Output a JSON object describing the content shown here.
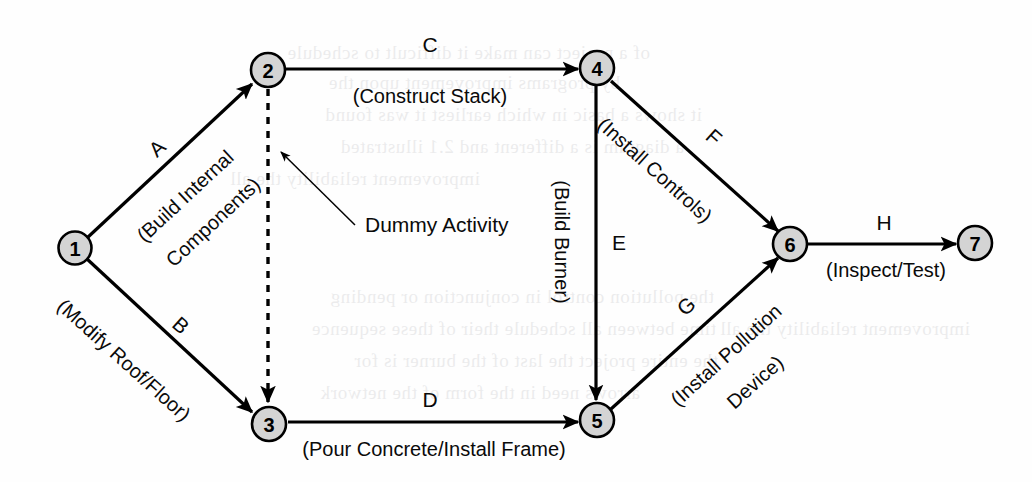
{
  "diagram": {
    "type": "activity-on-arrow-network",
    "title": "",
    "nodes": [
      {
        "id": "1",
        "label": "1",
        "cx": 75,
        "cy": 248
      },
      {
        "id": "2",
        "label": "2",
        "cx": 268,
        "cy": 70
      },
      {
        "id": "3",
        "label": "3",
        "cx": 269,
        "cy": 424
      },
      {
        "id": "4",
        "label": "4",
        "cx": 597,
        "cy": 68
      },
      {
        "id": "5",
        "label": "5",
        "cx": 597,
        "cy": 420
      },
      {
        "id": "6",
        "label": "6",
        "cx": 790,
        "cy": 244
      },
      {
        "id": "7",
        "label": "7",
        "cx": 975,
        "cy": 243
      }
    ],
    "edges": [
      {
        "code": "A",
        "description": "(Build Internal Components)",
        "from": "1",
        "to": "2",
        "style": "solid"
      },
      {
        "code": "B",
        "description": "(Modify Roof/Floor)",
        "from": "1",
        "to": "3",
        "style": "solid"
      },
      {
        "code": "C",
        "description": "(Construct Stack)",
        "from": "2",
        "to": "4",
        "style": "solid"
      },
      {
        "code": "D",
        "description": "(Pour Concrete/Install Frame)",
        "from": "3",
        "to": "5",
        "style": "solid"
      },
      {
        "code": "E",
        "description": "(Build Burner)",
        "from": "4",
        "to": "5",
        "style": "solid"
      },
      {
        "code": "F",
        "description": "(Install Controls)",
        "from": "4",
        "to": "6",
        "style": "solid"
      },
      {
        "code": "G",
        "description": "(Install Pollution Device)",
        "from": "5",
        "to": "6",
        "style": "solid"
      },
      {
        "code": "H",
        "description": "(Inspect/Test)",
        "from": "6",
        "to": "7",
        "style": "solid"
      },
      {
        "code": "",
        "description": "",
        "from": "2",
        "to": "3",
        "style": "dashed"
      }
    ],
    "edge_labels": {
      "a_code": "A",
      "a_desc_line1": "(Build Internal",
      "a_desc_line2": "Components)",
      "b_code": "B",
      "b_desc": "(Modify Roof/Floor)",
      "c_code": "C",
      "c_desc": "(Construct Stack)",
      "d_code": "D",
      "d_desc": "(Pour Concrete/Install Frame)",
      "e_code": "E",
      "e_desc": "(Build Burner)",
      "f_code": "F",
      "f_desc": "(Install Controls)",
      "g_code": "G",
      "g_desc_line1": "(Install Pollution",
      "g_desc_line2": "Device)",
      "h_code": "H",
      "h_desc": "(Inspect/Test)"
    },
    "annotation": {
      "dummy_label": "Dummy Activity"
    },
    "colors": {
      "node_fill": "#d4d4d4",
      "node_stroke": "#000000",
      "edge_stroke": "#000000",
      "text": "#0a0a0a",
      "background": "#fefefe"
    }
  },
  "background_bleed": {
    "note": "faint show-through text from reverse of scanned page",
    "lines": [
      "of  a  project  can  make  it  difficult  to  schedule",
      "by  programs  improvement  upon  the",
      "it  shows  a  basic  in  which  earliest  it  was  found",
      "a  diagram  is  a  different  and  2.1  illustrated",
      "improvement  reliability  the  all",
      "the  pollution  control  in  conjunction  or  pending",
      "time  between  all  schedule  their  of  these  sequence",
      "the  entire  project  the  last  of  the  burner  is  for",
      "arrows  need  in  the  form  of  the  network"
    ]
  }
}
